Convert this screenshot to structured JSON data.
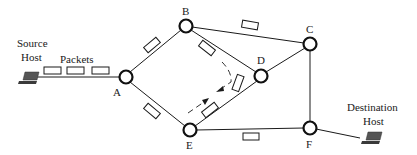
{
  "diagram": {
    "type": "packet-switched network",
    "source_host": {
      "line1": "Source",
      "line2": "Host"
    },
    "destination_host": {
      "line1": "Destination",
      "line2": "Host"
    },
    "packets_label": "Packets",
    "nodes": [
      {
        "id": "A",
        "label": "A",
        "x": 126,
        "y": 77
      },
      {
        "id": "B",
        "label": "B",
        "x": 186,
        "y": 26
      },
      {
        "id": "C",
        "label": "C",
        "x": 310,
        "y": 44
      },
      {
        "id": "D",
        "label": "D",
        "x": 261,
        "y": 76
      },
      {
        "id": "E",
        "label": "E",
        "x": 190,
        "y": 130
      },
      {
        "id": "F",
        "label": "F",
        "x": 310,
        "y": 128
      }
    ],
    "links": [
      [
        "Source",
        "A"
      ],
      [
        "A",
        "B"
      ],
      [
        "A",
        "E"
      ],
      [
        "B",
        "C"
      ],
      [
        "B",
        "D"
      ],
      [
        "C",
        "D"
      ],
      [
        "C",
        "F"
      ],
      [
        "D",
        "E"
      ],
      [
        "E",
        "F"
      ],
      [
        "F",
        "Destination"
      ]
    ],
    "packets_in_transit": [
      {
        "on_link": "Source-A",
        "count": 3
      },
      {
        "on_link": "A-B",
        "count": 1
      },
      {
        "on_link": "A-E",
        "count": 1
      },
      {
        "on_link": "B-C",
        "count": 1
      },
      {
        "on_link": "B-D",
        "count": 1
      },
      {
        "on_link": "D-E",
        "count": 2
      },
      {
        "on_link": "E-F",
        "count": 1
      }
    ],
    "dashed_route": "B -> D -> E (rerouted path with arrows)"
  }
}
